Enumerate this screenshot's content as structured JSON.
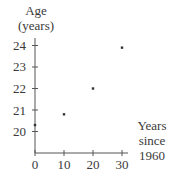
{
  "chart_data": {
    "type": "scatter",
    "title": "",
    "xlabel": "Years since 1960",
    "ylabel": "Age (years)",
    "xlabel_lines": [
      "Years",
      "since",
      "1960"
    ],
    "ylabel_lines": [
      "Age",
      "(years)"
    ],
    "x_ticks": [
      0,
      10,
      20,
      30
    ],
    "y_ticks": [
      20,
      21,
      22,
      23,
      24
    ],
    "xlim": [
      0,
      30
    ],
    "ylim": [
      20,
      24
    ],
    "grid": false,
    "legend": null,
    "points": [
      {
        "x": 0,
        "y": 20.3
      },
      {
        "x": 10,
        "y": 20.8
      },
      {
        "x": 20,
        "y": 22.0
      },
      {
        "x": 30,
        "y": 23.9
      }
    ],
    "x": [
      0,
      10,
      20,
      30
    ],
    "values": [
      20.3,
      20.8,
      22.0,
      23.9
    ]
  },
  "labels": {
    "y_line1": "Age",
    "y_line2": "(years)",
    "x_line1": "Years",
    "x_line2": "since",
    "x_line3": "1960",
    "yt": [
      "20",
      "21",
      "22",
      "23",
      "24"
    ],
    "xt": [
      "0",
      "10",
      "20",
      "30"
    ]
  },
  "colors": {
    "axis": "#555555",
    "point": "#333333",
    "text": "#3a3a3a"
  }
}
